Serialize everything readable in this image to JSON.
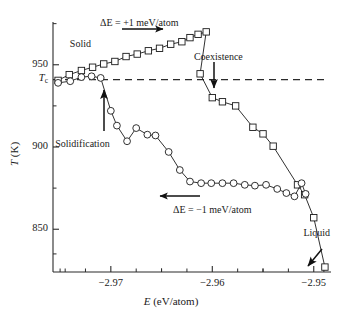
{
  "chart_data": {
    "type": "line",
    "title": "",
    "xlabel": "E (eV/atom)",
    "ylabel": "T (K)",
    "xlim": [
      -2.9757,
      -2.9483
    ],
    "ylim": [
      824,
      976
    ],
    "grid": false,
    "legend_position": "none",
    "x_ticks_major": [
      -2.97,
      -2.96,
      -2.95
    ],
    "x_tick_labels": [
      "−2.97",
      "−2.96",
      "−2.95"
    ],
    "x_ticks_minor": [
      -2.975,
      -2.965,
      -2.955
    ],
    "y_ticks_major": [
      950,
      900,
      850
    ],
    "y_tick_labels": [
      "950",
      "900",
      "850"
    ],
    "y_ticks_minor": [
      975,
      925,
      875,
      835
    ],
    "reference_line": {
      "label": "T_c",
      "label_text": "T",
      "label_sub": "c",
      "value": 941,
      "style": "dashed",
      "orientation": "horizontal"
    },
    "series": [
      {
        "name": "Heating branch",
        "marker": "square",
        "annotation": "ΔE = +1 meV/atom",
        "direction": "right",
        "points": [
          [
            -2.9752,
            940.5
          ],
          [
            -2.9741,
            944.0
          ],
          [
            -2.9729,
            946.5
          ],
          [
            -2.9718,
            948.5
          ],
          [
            -2.9707,
            950.5
          ],
          [
            -2.9696,
            952.0
          ],
          [
            -2.9685,
            955.0
          ],
          [
            -2.9674,
            956.5
          ],
          [
            -2.9663,
            958.5
          ],
          [
            -2.9652,
            960.0
          ],
          [
            -2.9641,
            962.5
          ],
          [
            -2.963,
            964.0
          ],
          [
            -2.9622,
            966.5
          ],
          [
            -2.9614,
            968.5
          ],
          [
            -2.9606,
            970.0
          ],
          [
            -2.9612,
            944.5
          ],
          [
            -2.96,
            930.0
          ],
          [
            -2.959,
            927.5
          ],
          [
            -2.9577,
            925.0
          ],
          [
            -2.956,
            912.0
          ],
          [
            -2.955,
            908.0
          ],
          [
            -2.954,
            900.5
          ],
          [
            -2.9516,
            877.0
          ],
          [
            -2.9509,
            871.0
          ],
          [
            -2.95,
            857.0
          ],
          [
            -2.9489,
            827.0
          ]
        ]
      },
      {
        "name": "Cooling branch",
        "marker": "circle",
        "annotation": "ΔE = −1 meV/atom",
        "direction": "left",
        "points": [
          [
            -2.9752,
            939.0
          ],
          [
            -2.974,
            940.0
          ],
          [
            -2.9729,
            942.5
          ],
          [
            -2.9719,
            943.0
          ],
          [
            -2.971,
            942.0
          ],
          [
            -2.97,
            922.0
          ],
          [
            -2.9694,
            913.0
          ],
          [
            -2.9684,
            903.5
          ],
          [
            -2.9675,
            911.5
          ],
          [
            -2.9664,
            907.5
          ],
          [
            -2.9656,
            907.0
          ],
          [
            -2.9643,
            897.0
          ],
          [
            -2.9632,
            886.0
          ],
          [
            -2.9622,
            879.0
          ],
          [
            -2.9611,
            878.0
          ],
          [
            -2.9601,
            878.0
          ],
          [
            -2.959,
            878.0
          ],
          [
            -2.9579,
            878.0
          ],
          [
            -2.9568,
            877.0
          ],
          [
            -2.9558,
            876.5
          ],
          [
            -2.9547,
            877.0
          ],
          [
            -2.9536,
            874.5
          ],
          [
            -2.9527,
            872.0
          ],
          [
            -2.9519,
            870.0
          ],
          [
            -2.9512,
            878.0
          ],
          [
            -2.9508,
            871.5
          ]
        ]
      }
    ],
    "annotations": [
      {
        "name": "solid-label",
        "text": "Solid",
        "x": -2.973,
        "y": 962
      },
      {
        "name": "coexistence-label",
        "text": "Coexistence",
        "x": -2.9594,
        "y": 954
      },
      {
        "name": "solidification-label",
        "text": "Solidification",
        "x": -2.9728,
        "y": 901
      },
      {
        "name": "liquid-label",
        "text": "Liquid",
        "x": -2.9497,
        "y": 847
      },
      {
        "name": "heating-delta-label",
        "text": "ΔE = +1 meV/atom",
        "x": -2.9672,
        "y": 975
      },
      {
        "name": "cooling-delta-label",
        "text": "ΔE = −1 meV/atom",
        "x": -2.96,
        "y": 861
      }
    ]
  },
  "axes": {
    "x_title_italic": "E",
    "x_title_rest": " (eV/atom)",
    "y_title_italic": "T",
    "y_title_rest": " (K)"
  }
}
